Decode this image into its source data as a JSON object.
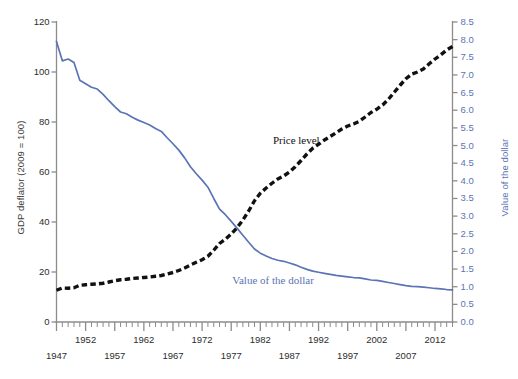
{
  "chart_data": {
    "type": "line",
    "title": "",
    "subtitle": "",
    "xlabel": "",
    "ylabel": "GDP deflator (2009 = 100)",
    "y2label": "Value of the dollar",
    "xlim": [
      1947,
      2015
    ],
    "ylim": [
      0,
      120
    ],
    "y2lim": [
      0.0,
      8.5
    ],
    "grid": false,
    "legend_position": "inline-annotations",
    "y_ticks": [
      0,
      20,
      40,
      60,
      80,
      100,
      120
    ],
    "y2_ticks": [
      "0.0",
      "0.5",
      "1.0",
      "1.5",
      "2.0",
      "2.5",
      "3.0",
      "3.5",
      "4.0",
      "4.5",
      "5.0",
      "5.5",
      "6.0",
      "6.5",
      "7.0",
      "7.5",
      "8.0",
      "8.5"
    ],
    "x_ticks_row1": [
      1952,
      1962,
      1972,
      1982,
      1992,
      2002,
      2012
    ],
    "x_ticks_row2": [
      1947,
      1957,
      1967,
      1977,
      1987,
      1997,
      2007
    ],
    "x_minor_tick_interval": 1,
    "x_major_tick_interval": 5,
    "annotations": [
      {
        "text": "Price level",
        "x": 1990,
        "y": 72,
        "color": "#111111"
      },
      {
        "text": "Value of the dollar",
        "x": 1988,
        "y": 16,
        "color": "#5b74b5"
      }
    ],
    "series": [
      {
        "name": "Price level",
        "axis": "left",
        "color": "#111111",
        "style": "dashed",
        "x": [
          1947,
          1948,
          1949,
          1950,
          1951,
          1952,
          1953,
          1954,
          1955,
          1956,
          1957,
          1958,
          1959,
          1960,
          1961,
          1962,
          1963,
          1964,
          1965,
          1966,
          1967,
          1968,
          1969,
          1970,
          1971,
          1972,
          1973,
          1974,
          1975,
          1976,
          1977,
          1978,
          1979,
          1980,
          1981,
          1982,
          1983,
          1984,
          1985,
          1986,
          1987,
          1988,
          1989,
          1990,
          1991,
          1992,
          1993,
          1994,
          1995,
          1996,
          1997,
          1998,
          1999,
          2000,
          2001,
          2002,
          2003,
          2004,
          2005,
          2006,
          2007,
          2008,
          2009,
          2010,
          2011,
          2012,
          2013,
          2014,
          2015
        ],
        "values": [
          12.7,
          13.6,
          13.5,
          13.7,
          14.7,
          14.9,
          15.1,
          15.2,
          15.5,
          16.0,
          16.5,
          16.9,
          17.1,
          17.4,
          17.6,
          17.8,
          18.0,
          18.3,
          18.6,
          19.2,
          19.8,
          20.6,
          21.6,
          22.8,
          23.9,
          24.9,
          26.3,
          28.7,
          31.4,
          33.1,
          35.2,
          37.7,
          40.8,
          44.4,
          48.5,
          51.5,
          53.6,
          55.5,
          57.2,
          58.4,
          60.0,
          62.1,
          64.6,
          67.2,
          69.5,
          71.1,
          72.8,
          74.2,
          75.7,
          77.2,
          78.4,
          79.2,
          80.3,
          82.0,
          83.8,
          85.1,
          86.8,
          89.1,
          91.9,
          94.7,
          97.3,
          99.2,
          100.0,
          101.2,
          103.3,
          105.2,
          106.9,
          108.8,
          110.2
        ]
      },
      {
        "name": "Value of the dollar",
        "axis": "right",
        "color": "#5b74b5",
        "style": "solid",
        "x": [
          1947,
          1948,
          1949,
          1950,
          1951,
          1952,
          1953,
          1954,
          1955,
          1956,
          1957,
          1958,
          1959,
          1960,
          1961,
          1962,
          1963,
          1964,
          1965,
          1966,
          1967,
          1968,
          1969,
          1970,
          1971,
          1972,
          1973,
          1974,
          1975,
          1976,
          1977,
          1978,
          1979,
          1980,
          1981,
          1982,
          1983,
          1984,
          1985,
          1986,
          1987,
          1988,
          1989,
          1990,
          1991,
          1992,
          1993,
          1994,
          1995,
          1996,
          1997,
          1998,
          1999,
          2000,
          2001,
          2002,
          2003,
          2004,
          2005,
          2006,
          2007,
          2008,
          2009,
          2010,
          2011,
          2012,
          2013,
          2014,
          2015
        ],
        "values": [
          7.95,
          7.4,
          7.45,
          7.35,
          6.85,
          6.75,
          6.65,
          6.6,
          6.45,
          6.27,
          6.1,
          5.95,
          5.9,
          5.8,
          5.72,
          5.65,
          5.58,
          5.48,
          5.4,
          5.22,
          5.05,
          4.87,
          4.65,
          4.4,
          4.2,
          4.02,
          3.82,
          3.5,
          3.2,
          3.04,
          2.85,
          2.66,
          2.46,
          2.26,
          2.07,
          1.95,
          1.87,
          1.8,
          1.75,
          1.72,
          1.67,
          1.62,
          1.55,
          1.49,
          1.44,
          1.41,
          1.38,
          1.35,
          1.32,
          1.3,
          1.28,
          1.26,
          1.25,
          1.22,
          1.19,
          1.18,
          1.15,
          1.12,
          1.09,
          1.06,
          1.03,
          1.01,
          1.0,
          0.99,
          0.97,
          0.95,
          0.94,
          0.92,
          0.91
        ]
      }
    ]
  },
  "colors": {
    "price_level": "#111111",
    "dollar_value": "#5b74b5",
    "axis": "#8c8c8c",
    "background": "#ffffff"
  }
}
